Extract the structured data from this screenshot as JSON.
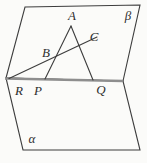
{
  "diagram": {
    "points": {
      "A": "A",
      "B": "B",
      "C": "C",
      "R": "R",
      "P": "P",
      "Q": "Q"
    },
    "planes": {
      "beta": "β",
      "alpha": "α"
    }
  },
  "colors": {
    "background": "#fbfbf9",
    "line": "#3d3d3d",
    "intersection": "#8e8e8e",
    "text": "#2e2e2e"
  }
}
